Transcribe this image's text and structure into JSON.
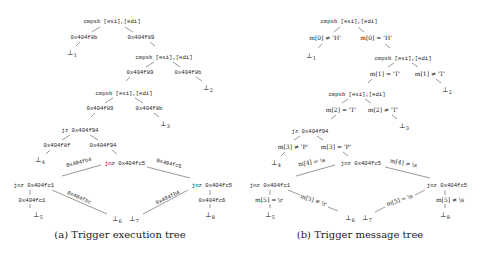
{
  "panels": {
    "a": {
      "caption": "(a) Trigger execution tree",
      "nodes": {
        "root": "cmpsb [esi],[edi]",
        "cmp2": "cmpsb [esi],[edi]",
        "cmp3": "cmpsb [esi],[edi]",
        "jz": "jz 0x404f94",
        "jnz_mid": "jnz 0x404fc5",
        "jnz_left": "jnz 0x404fc1",
        "jnz_right": "jnz 0x404fc5"
      },
      "edges": {
        "root_left": "0x404f8b",
        "root_right": "0x404f89",
        "cmp2_left": "0x404f89",
        "cmp2_right": "0x404f8b",
        "cmp3_left": "0x404f89",
        "cmp3_right": "0x404f8b",
        "jz_left": "0x404f8f",
        "jz_right": "0x404f94",
        "mid_left": "0x404fb4",
        "mid_right": "0x404fc5",
        "left_down": "0x404fc1",
        "left_diag": "0x404fbc",
        "right_diag": "0x404fb4",
        "right_down": "0x404fc6"
      },
      "leaves": [
        "⊥1",
        "⊥2",
        "⊥3",
        "⊥4",
        "⊥5",
        "⊥6",
        "⊥7",
        "⊥8"
      ]
    },
    "b": {
      "caption": "(b) Trigger message tree",
      "nodes": {
        "root": "cmpsb [esi],[edi]",
        "cmp2": "cmpsb [esi],[edi]",
        "cmp3": "cmpsb [esi],[edi]",
        "jz": "jz 0x404f94",
        "jnz_mid": "jnz 0x404fc5",
        "jnz_left": "jnz 0x404fc1",
        "jnz_right": "jnz 0x404fc5"
      },
      "edges": {
        "root_left": "m[0] ≠ 'H'",
        "root_right": "m[0] = 'H'",
        "cmp2_left": "m[1] = 'T'",
        "cmp2_right": "m[1] ≠ 'T'",
        "cmp3_left": "m[2] = 'T'",
        "cmp3_right": "m[2] ≠ 'T'",
        "jz_left": "m[3] ≠ 'P'",
        "jz_right": "m[3] = 'P'",
        "mid_left": "m[4] = \\s",
        "mid_right": "m[4] ≠ \\s",
        "left_down": "m[5] = \\r",
        "left_diag": "m[5] ≠ \\r",
        "right_diag": "m[5] = \\s",
        "right_down": "m[5] ≠ \\s"
      },
      "leaves": [
        "⊥1",
        "⊥2",
        "⊥3",
        "⊥4",
        "⊥5",
        "⊥6",
        "⊥7",
        "⊥8"
      ]
    }
  }
}
